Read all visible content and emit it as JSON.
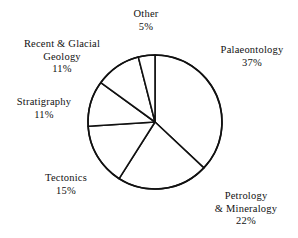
{
  "chart_data": {
    "type": "pie",
    "title": "",
    "subtitle": "",
    "xlabel": "",
    "ylabel": "",
    "legend_position": "none",
    "grid": false,
    "unit": "%",
    "start_angle_deg": 0,
    "direction": "clockwise",
    "categories": [
      "Palaeontology",
      "Petrology & Mineralogy",
      "Tectonics",
      "Stratigraphy",
      "Recent & Glacial Geology",
      "Other"
    ],
    "values": [
      37,
      22,
      15,
      11,
      11,
      5
    ],
    "slices": [
      {
        "name": "Palaeontology",
        "label_lines": [
          "Palaeontology"
        ],
        "value": 37,
        "value_text": "37%",
        "start_deg": 0,
        "end_deg": 133.2,
        "fill": "#ffffff",
        "stroke": "#111111"
      },
      {
        "name": "Petrology & Mineralogy",
        "label_lines": [
          "Petrology",
          "& Mineralogy"
        ],
        "value": 22,
        "value_text": "22%",
        "start_deg": 133.2,
        "end_deg": 212.4,
        "fill": "#ffffff",
        "stroke": "#111111"
      },
      {
        "name": "Tectonics",
        "label_lines": [
          "Tectonics"
        ],
        "value": 15,
        "value_text": "15%",
        "start_deg": 212.4,
        "end_deg": 266.4,
        "fill": "#ffffff",
        "stroke": "#111111"
      },
      {
        "name": "Stratigraphy",
        "label_lines": [
          "Stratigraphy"
        ],
        "value": 11,
        "value_text": "11%",
        "start_deg": 266.4,
        "end_deg": 306.0,
        "fill": "#ffffff",
        "stroke": "#111111"
      },
      {
        "name": "Recent & Glacial Geology",
        "label_lines": [
          "Recent & Glacial",
          "Geology"
        ],
        "value": 11,
        "value_text": "11%",
        "start_deg": 306.0,
        "end_deg": 345.6,
        "fill": "#ffffff",
        "stroke": "#111111"
      },
      {
        "name": "Other",
        "label_lines": [
          "Other"
        ],
        "value": 5,
        "value_text": "5%",
        "start_deg": 345.6,
        "end_deg": 360.0,
        "fill": "#ffffff",
        "stroke": "#111111"
      }
    ]
  },
  "labels": {
    "other": {
      "name": "Other",
      "value": "5%"
    },
    "palaeontology": {
      "name": "Palaeontology",
      "value": "37%"
    },
    "petrology": {
      "name_line1": "Petrology",
      "name_line2": "& Mineralogy",
      "value": "22%"
    },
    "tectonics": {
      "name": "Tectonics",
      "value": "15%"
    },
    "stratigraphy": {
      "name": "Stratigraphy",
      "value": "11%"
    },
    "recent": {
      "name_line1": "Recent & Glacial",
      "name_line2": "Geology",
      "value": "11%"
    }
  },
  "style": {
    "background": "#ffffff",
    "stroke": "#111111",
    "slice_fill": "#ffffff",
    "text_color": "#111111"
  }
}
